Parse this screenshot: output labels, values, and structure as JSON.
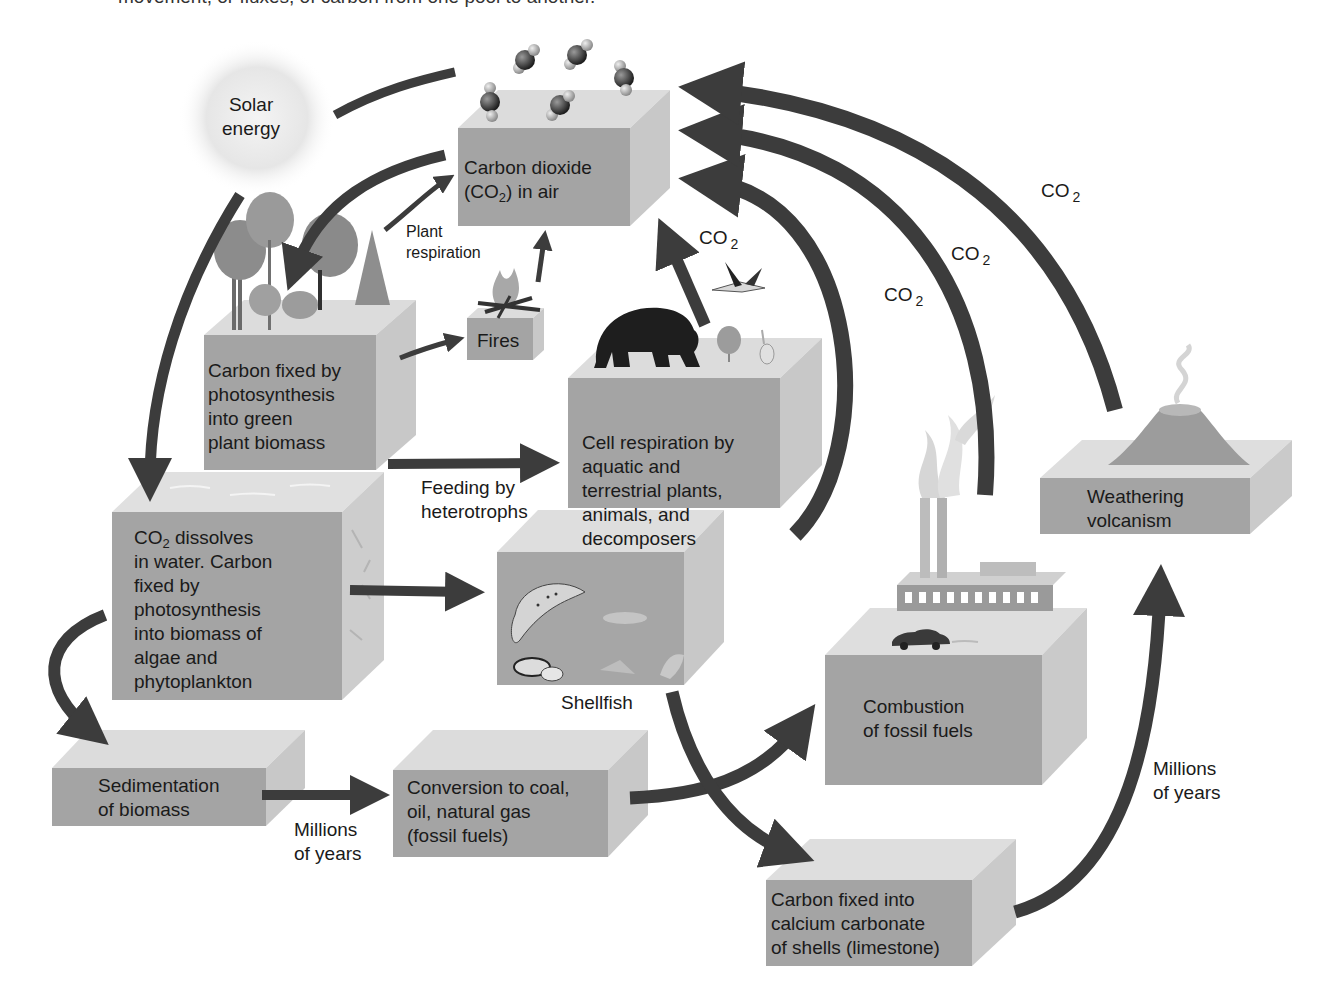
{
  "caption": "movement, or fluxes, of carbon from one pool to another.",
  "colors": {
    "front_face": "#a4a4a4",
    "top_face": "#dcdcdc",
    "side_face": "#c6c6c6",
    "arrow": "#3c3c3c",
    "text": "#1a1a1a",
    "sun_glow": "#e8e8e8"
  },
  "nodes": {
    "solar": {
      "label": "Solar\nenergy"
    },
    "co2_air": {
      "label_main": "Carbon dioxide",
      "label_pre": "(CO",
      "label_sub": "2",
      "label_post": ") in air"
    },
    "plant_biomass": {
      "label": "Carbon fixed by\nphotosynthesis\ninto green\nplant biomass"
    },
    "fires": {
      "label": "Fires"
    },
    "cell_respiration": {
      "label": "Cell respiration by\naquatic and\nterrestrial plants,\nanimals, and\ndecomposers"
    },
    "water": {
      "label_pre": "CO",
      "label_sub": "2",
      "label_post": " dissolves\nin water. Carbon\nfixed by\nphotosynthesis\ninto biomass of\nalgae and\nphytoplankton"
    },
    "aquatic": {
      "label": "Shellfish"
    },
    "sedimentation": {
      "label": "Sedimentation\nof biomass"
    },
    "fossil_conversion": {
      "label": "Conversion to coal,\noil, natural gas\n(fossil fuels)"
    },
    "combustion": {
      "label": "Combustion\nof fossil fuels"
    },
    "limestone": {
      "label": "Carbon fixed into\ncalcium carbonate\nof shells (limestone)"
    },
    "weathering": {
      "label": "Weathering\nvolcanism"
    }
  },
  "flux_labels": {
    "plant_respiration": "Plant\nrespiration",
    "feeding": "Feeding by\nheterotrophs",
    "millions_years_left": "Millions\nof years",
    "millions_years_right": "Millions\nof years",
    "co2_main": "CO",
    "co2_sub": "2"
  },
  "co2_arrow_labels": [
    {
      "id": "respiration",
      "text": "CO",
      "sub": "2"
    },
    {
      "id": "decomposers",
      "text": "CO",
      "sub": "2"
    },
    {
      "id": "combustion",
      "text": "CO",
      "sub": "2"
    },
    {
      "id": "volcanism",
      "text": "CO",
      "sub": "2"
    }
  ]
}
